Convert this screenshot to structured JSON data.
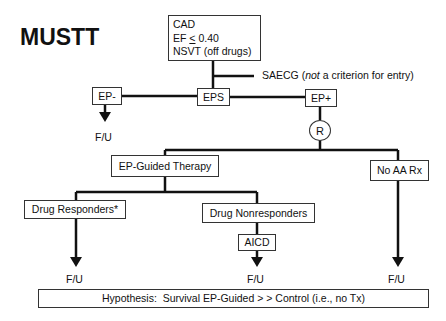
{
  "diagram": {
    "title": "MUSTT",
    "entry_criteria": {
      "line1": "CAD",
      "line2_prefix": "EF ",
      "line2_symbol": "<",
      "line2_value": " 0.40",
      "line3": "NSVT (off drugs)"
    },
    "saecg": {
      "text_before": "SAECG (",
      "text_italic": "not",
      "text_after": " a criterion for entry)"
    },
    "nodes": {
      "ep_minus": "EP-",
      "eps": "EPS",
      "ep_plus": "EP+",
      "randomize": "R",
      "ep_guided": "EP-Guided Therapy",
      "no_aa_rx": "No AA Rx",
      "drug_responders": "Drug Responders*",
      "drug_nonresponders": "Drug Nonresponders",
      "aicd": "AICD"
    },
    "follow_up": {
      "ep_minus": "F/U",
      "drug_responders": "F/U",
      "aicd": "F/U",
      "no_aa_rx": "F/U"
    },
    "hypothesis": "Hypothesis:  Survival EP-Guided > > Control (i.e., no Tx)",
    "colors": {
      "line": "#111111",
      "box_border": "#333333",
      "background": "#ffffff"
    }
  }
}
